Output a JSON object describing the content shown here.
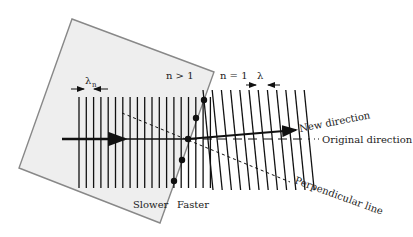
{
  "diagram": {
    "labels": {
      "lambda_n": "λ",
      "lambda_n_sub": "n",
      "n_gt_1": "n > 1",
      "n_eq_1": "n = 1",
      "lambda": "λ",
      "new_direction": "New direction",
      "original_direction": "Original direction",
      "perpendicular_line": "Perpendicular line",
      "slower": "Slower",
      "faster": "Faster"
    },
    "colors": {
      "medium_fill": "#eeeeee",
      "medium_border": "#888888",
      "wavefront": "#111111",
      "arrow": "#111111"
    },
    "wavefronts_in_medium": 19,
    "wavefronts_in_air": 12,
    "boundary_points": 5
  }
}
